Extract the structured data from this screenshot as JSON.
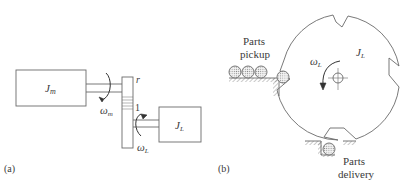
{
  "panel_a": {
    "label": "(a)",
    "motor_inertia": {
      "symbol": "J",
      "subscript": "m"
    },
    "load_inertia": {
      "symbol": "J",
      "subscript": "L"
    },
    "motor_speed": {
      "symbol": "ω",
      "subscript": "m"
    },
    "load_speed": {
      "symbol": "ω",
      "subscript": "L"
    },
    "gear_ratio_top": "r",
    "gear_ratio_bottom": "1"
  },
  "panel_b": {
    "label": "(b)",
    "disc_inertia": {
      "symbol": "J",
      "subscript": "L"
    },
    "disc_speed": {
      "symbol": "ω",
      "subscript": "L"
    },
    "pickup_line1": "Parts",
    "pickup_line2": "pickup",
    "delivery_line1": "Parts",
    "delivery_line2": "delivery"
  },
  "colors": {
    "line": "#6a6a6a",
    "text": "#3a3a3a",
    "part_fill": "#d8d8d8"
  }
}
